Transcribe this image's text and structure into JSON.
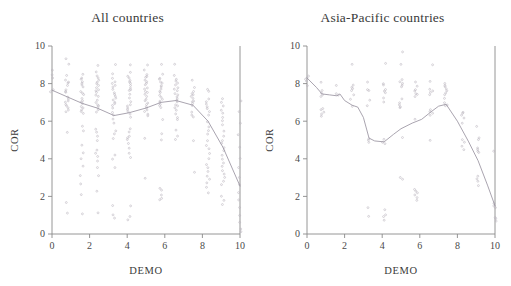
{
  "figure": {
    "background_color": "#ffffff",
    "point_color": "#b9b3bd",
    "curve_color": "#9a93a0",
    "axis_color": "#8a8a8a"
  },
  "panels": [
    {
      "id": "all-countries",
      "title": "All countries",
      "xlabel": "DEMO",
      "ylabel": "COR"
    },
    {
      "id": "asia-pacific-countries",
      "title": "Asia-Pacific countries",
      "xlabel": "DEMO",
      "ylabel": "COR"
    }
  ],
  "axes": {
    "x_ticks": [
      "0",
      "2",
      "4",
      "6",
      "8",
      "10"
    ],
    "y_ticks": [
      "0",
      "2",
      "4",
      "6",
      "8",
      "10"
    ],
    "xlim": [
      0,
      10
    ],
    "ylim": [
      0,
      10
    ]
  },
  "chart_data": [
    {
      "type": "scatter",
      "title": "All countries",
      "xlabel": "DEMO",
      "ylabel": "COR",
      "xlim": [
        0,
        10
      ],
      "ylim": [
        0,
        10
      ],
      "grid": false,
      "legend": "none",
      "x_ticks": [
        0,
        2,
        4,
        6,
        8,
        10
      ],
      "y_ticks": [
        0,
        2,
        4,
        6,
        8,
        10
      ],
      "series": [
        {
          "name": "lowess smooth",
          "type": "line",
          "x": [
            0,
            0.8,
            1.6,
            2.4,
            3.3,
            4.1,
            5.0,
            5.8,
            6.6,
            7.5,
            8.3,
            9.1,
            10
          ],
          "values": [
            7.65,
            7.3,
            6.95,
            6.7,
            6.3,
            6.45,
            6.7,
            7.0,
            7.1,
            6.85,
            6.0,
            4.6,
            2.55
          ]
        },
        {
          "name": "country observations",
          "type": "scatter",
          "columns": [
            {
              "x": 0.0,
              "y": [
                8.7,
                8.5,
                8.3,
                7.7,
                7.6
              ]
            },
            {
              "x": 0.8,
              "y": [
                9.3,
                9.0,
                8.4,
                8.2,
                8.1,
                8.0,
                7.9,
                7.7,
                7.6,
                7.5,
                7.3,
                7.2,
                7.1,
                7.0,
                6.9,
                6.8,
                6.7,
                6.6,
                6.5,
                5.4,
                1.7,
                1.1
              ]
            },
            {
              "x": 1.6,
              "y": [
                8.5,
                8.3,
                8.2,
                8.1,
                8.0,
                7.9,
                7.8,
                7.6,
                7.5,
                7.4,
                7.2,
                7.1,
                7.0,
                6.9,
                6.8,
                6.7,
                6.6,
                6.5,
                6.4,
                5.7,
                5.5,
                4.7,
                4.3,
                4.0,
                3.6,
                3.1,
                2.7,
                2.1,
                1.1
              ]
            },
            {
              "x": 2.4,
              "y": [
                9.0,
                8.6,
                8.4,
                8.3,
                8.2,
                8.1,
                8.0,
                7.9,
                7.8,
                7.7,
                7.6,
                7.5,
                7.4,
                7.3,
                7.1,
                7.0,
                6.9,
                6.8,
                6.7,
                6.6,
                6.5,
                5.6,
                5.4,
                5.2,
                5.0,
                4.5,
                4.3,
                4.1,
                3.9,
                3.5,
                3.1,
                2.3,
                1.1
              ]
            },
            {
              "x": 3.3,
              "y": [
                9.0,
                8.5,
                8.3,
                8.1,
                8.0,
                7.9,
                7.8,
                7.7,
                7.5,
                7.4,
                7.3,
                7.2,
                7.1,
                7.0,
                6.9,
                6.8,
                6.7,
                6.5,
                6.3,
                6.1,
                5.9,
                5.5,
                5.3,
                5.1,
                4.2,
                4.0,
                3.5,
                1.5,
                1.0,
                0.85
              ]
            },
            {
              "x": 4.1,
              "y": [
                9.0,
                8.6,
                8.4,
                8.3,
                8.2,
                8.1,
                8.0,
                7.9,
                7.8,
                7.7,
                7.6,
                7.4,
                7.2,
                7.0,
                6.9,
                6.8,
                6.7,
                6.6,
                6.5,
                6.4,
                6.2,
                5.6,
                5.4,
                5.2,
                5.1,
                5.0,
                4.8,
                4.6,
                4.3,
                4.1,
                1.5,
                0.9,
                0.75
              ]
            },
            {
              "x": 5.0,
              "y": [
                9.0,
                8.7,
                8.5,
                8.4,
                8.3,
                8.2,
                8.1,
                8.0,
                7.9,
                7.8,
                7.7,
                7.6,
                7.5,
                7.4,
                7.3,
                7.2,
                7.1,
                7.0,
                6.9,
                6.8,
                6.7,
                6.6,
                6.5,
                6.4,
                6.3,
                5.1,
                3.0
              ]
            },
            {
              "x": 5.8,
              "y": [
                9.0,
                8.5,
                8.3,
                8.2,
                8.1,
                8.0,
                7.9,
                7.8,
                7.7,
                7.6,
                7.5,
                7.4,
                7.3,
                7.2,
                7.1,
                7.0,
                6.9,
                6.8,
                6.7,
                6.1,
                5.3,
                5.0,
                2.4,
                2.3,
                2.1,
                1.9,
                1.8
              ]
            },
            {
              "x": 6.6,
              "y": [
                9.0,
                8.4,
                8.2,
                8.1,
                8.0,
                7.9,
                7.8,
                7.7,
                7.6,
                7.5,
                7.4,
                7.3,
                7.2,
                7.1,
                7.0,
                6.9,
                6.8,
                6.7,
                6.6,
                6.4,
                6.2,
                6.1,
                5.5,
                5.2,
                5.0
              ]
            },
            {
              "x": 7.5,
              "y": [
                8.2,
                7.8,
                7.6,
                7.5,
                7.4,
                7.3,
                7.2,
                7.1,
                7.0,
                6.9,
                6.8,
                6.5,
                6.3,
                6.2,
                5.0,
                3.3
              ]
            },
            {
              "x": 8.3,
              "y": [
                7.7,
                7.6,
                7.2,
                7.0,
                6.9,
                6.8,
                6.7,
                6.5,
                6.3,
                6.0,
                5.7,
                5.5,
                5.3,
                5.0,
                4.7,
                4.5,
                4.3,
                4.0,
                3.7,
                3.5,
                3.3,
                3.1,
                2.9,
                2.7,
                2.5,
                2.2
              ]
            },
            {
              "x": 9.1,
              "y": [
                7.2,
                7.0,
                6.8,
                6.6,
                6.4,
                6.2,
                6.0,
                5.8,
                5.5,
                5.2,
                5.0,
                4.8,
                4.6,
                4.4,
                4.2,
                4.0,
                3.8,
                3.6,
                3.4,
                3.2,
                3.0,
                2.8,
                2.6,
                2.0,
                1.8,
                1.6
              ]
            },
            {
              "x": 10.0,
              "y": [
                7.1,
                6.5,
                5.9,
                5.3,
                4.6,
                4.0,
                3.5,
                3.0,
                2.6,
                2.2,
                1.8,
                1.4,
                1.0,
                0.6,
                0.3,
                0.1
              ]
            }
          ]
        }
      ]
    },
    {
      "type": "scatter",
      "title": "Asia-Pacific countries",
      "xlabel": "DEMO",
      "ylabel": "COR",
      "xlim": [
        0,
        10
      ],
      "ylim": [
        0,
        10
      ],
      "grid": false,
      "legend": "none",
      "x_ticks": [
        0,
        2,
        4,
        6,
        8,
        10
      ],
      "y_ticks": [
        0,
        2,
        4,
        6,
        8,
        10
      ],
      "series": [
        {
          "name": "lowess smooth",
          "type": "line",
          "x": [
            0,
            0.5,
            0.8,
            1.2,
            1.6,
            1.75,
            2.0,
            2.4,
            2.7,
            3.0,
            3.3,
            3.6,
            4.1,
            4.6,
            5.0,
            5.6,
            6.1,
            6.6,
            7.0,
            7.4,
            8.0,
            8.6,
            9.1,
            9.6,
            10
          ],
          "values": [
            8.3,
            7.8,
            7.45,
            7.4,
            7.35,
            7.45,
            7.1,
            6.85,
            6.75,
            6.2,
            5.1,
            4.95,
            4.9,
            5.3,
            5.6,
            5.9,
            6.1,
            6.5,
            6.8,
            6.9,
            6.0,
            4.9,
            3.9,
            2.6,
            1.5
          ]
        },
        {
          "name": "country observations",
          "type": "scatter",
          "columns": [
            {
              "x": 0.0,
              "y": [
                8.4,
                8.3,
                8.2,
                8.1,
                7.9
              ]
            },
            {
              "x": 0.8,
              "y": [
                8.1,
                7.6,
                7.5,
                7.4,
                7.3,
                6.7,
                6.6,
                6.5,
                6.4,
                6.3
              ]
            },
            {
              "x": 1.6,
              "y": [
                7.9,
                7.5,
                7.4
              ]
            },
            {
              "x": 2.4,
              "y": [
                9.0,
                7.9,
                7.8,
                7.7,
                7.6,
                7.4,
                7.2,
                6.8
              ]
            },
            {
              "x": 3.3,
              "y": [
                8.1,
                7.7,
                7.6,
                7.1,
                6.8,
                5.1,
                5.0,
                4.9,
                1.4,
                0.95
              ]
            },
            {
              "x": 4.1,
              "y": [
                9.1,
                8.0,
                7.9,
                7.7,
                7.6,
                7.5,
                7.2,
                7.0,
                5.0,
                4.9,
                4.8,
                1.3,
                1.0,
                0.9,
                0.75
              ]
            },
            {
              "x": 5.0,
              "y": [
                9.7,
                9.0,
                8.2,
                8.1,
                8.0,
                7.9,
                7.8,
                7.2,
                7.0,
                6.9,
                6.8,
                6.7,
                5.1,
                3.0,
                2.9
              ]
            },
            {
              "x": 5.8,
              "y": [
                8.1,
                7.9,
                7.7,
                7.6,
                7.5,
                7.4,
                7.3,
                6.1,
                2.4,
                2.3,
                2.2,
                2.1,
                1.9,
                1.8
              ]
            },
            {
              "x": 6.6,
              "y": [
                9.0,
                8.1,
                7.7,
                7.6,
                7.5,
                7.4,
                6.6,
                6.5,
                6.4,
                6.3,
                5.0
              ]
            },
            {
              "x": 7.4,
              "y": [
                8.0,
                7.9,
                7.8,
                7.7,
                7.6,
                7.5,
                7.4,
                7.2,
                7.0,
                6.9,
                6.8
              ]
            },
            {
              "x": 8.3,
              "y": [
                6.5,
                6.4,
                6.3,
                6.2,
                5.9,
                5.0,
                4.9,
                4.7,
                4.5
              ]
            },
            {
              "x": 9.1,
              "y": [
                5.7,
                5.1,
                5.0,
                4.6,
                4.5,
                4.4,
                4.3,
                3.1,
                2.9,
                2.8,
                2.6
              ]
            },
            {
              "x": 10.0,
              "y": [
                4.4,
                1.6,
                1.5,
                1.4,
                0.9,
                0.8,
                0.7
              ]
            }
          ]
        }
      ]
    }
  ]
}
